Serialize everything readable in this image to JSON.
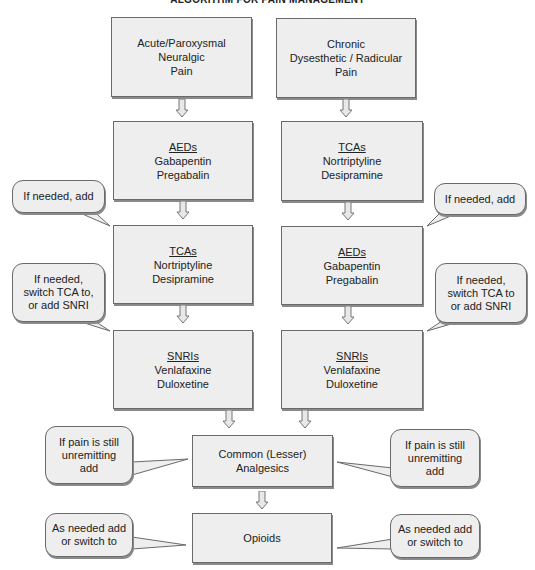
{
  "title": "ALGORITHM FOR PAIN MANAGEMENT",
  "colors": {
    "box_fill": "#eeeeee",
    "border": "#6a6a6a",
    "shadow": "#8a8a8a",
    "background": "#ffffff"
  },
  "left_column": {
    "start": {
      "lines": [
        "Acute/Paroxysmal",
        "Neuralgic",
        "Pain"
      ]
    },
    "step1": {
      "heading": "AEDs",
      "lines": [
        "Gabapentin",
        "Pregabalin"
      ]
    },
    "step2": {
      "heading": "TCAs",
      "lines": [
        "Nortriptyline",
        "Desipramine"
      ]
    },
    "step3": {
      "heading": "SNRIs",
      "lines": [
        "Venlafaxine",
        "Duloxetine"
      ]
    }
  },
  "right_column": {
    "start": {
      "lines": [
        "Chronic",
        "Dysesthetic / Radicular",
        "Pain"
      ]
    },
    "step1": {
      "heading": "TCAs",
      "lines": [
        "Nortriptyline",
        "Desipramine"
      ]
    },
    "step2": {
      "heading": "AEDs",
      "lines": [
        "Gabapentin",
        "Pregabalin"
      ]
    },
    "step3": {
      "heading": "SNRIs",
      "lines": [
        "Venlafaxine",
        "Duloxetine"
      ]
    }
  },
  "shared": {
    "analgesics": {
      "lines": [
        "Common (Lesser)",
        "Analgesics"
      ]
    },
    "opioids": {
      "lines": [
        "Opioids"
      ]
    }
  },
  "callouts": {
    "left_add": {
      "lines": [
        "If needed, add"
      ]
    },
    "left_switch": {
      "lines": [
        "If needed,",
        "switch TCA to,",
        "or add SNRI"
      ]
    },
    "right_add": {
      "lines": [
        "If needed, add"
      ]
    },
    "right_switch": {
      "lines": [
        "If needed,",
        "switch TCA to",
        "or add SNRI"
      ]
    },
    "left_unremitting": {
      "lines": [
        "If pain is still",
        "unremitting",
        "add"
      ]
    },
    "right_unremitting": {
      "lines": [
        "If pain is still",
        "unremitting",
        "add"
      ]
    },
    "left_opioid": {
      "lines": [
        "As needed add",
        "or switch to"
      ]
    },
    "right_opioid": {
      "lines": [
        "As needed add",
        "or switch to"
      ]
    }
  },
  "icons": {
    "flow_arrow": "hollow-down-arrow"
  }
}
